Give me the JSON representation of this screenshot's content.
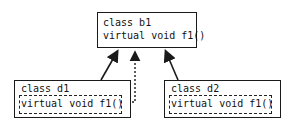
{
  "diagram": {
    "base_class": {
      "name_line": "class b1",
      "method_line": "virtual void f1()"
    },
    "derived_classes": [
      {
        "name_line": "class d1",
        "method_line": "virtual void f1()"
      },
      {
        "name_line": "class d2",
        "method_line": "virtual void f1()"
      }
    ],
    "edges": [
      {
        "from": "class d1",
        "to": "class b1",
        "style": "solid",
        "arrowhead": "filled"
      },
      {
        "from": "class d1 virtual void f1()",
        "to": "class b1",
        "style": "dotted",
        "arrowhead": "filled"
      },
      {
        "from": "class d2",
        "to": "class b1",
        "style": "solid",
        "arrowhead": "filled"
      }
    ],
    "colors": {
      "stroke": "#1a1a1a",
      "background": "#ffffff"
    }
  }
}
